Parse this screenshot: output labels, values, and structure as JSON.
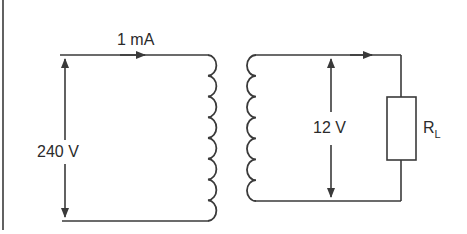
{
  "diagram": {
    "type": "transformer-circuit",
    "primary": {
      "current_label": "1 mA",
      "voltage_label": "240 V",
      "coil_turns": 8
    },
    "secondary": {
      "voltage_label": "12 V",
      "coil_turns": 7,
      "load": {
        "label_main": "R",
        "label_sub": "L"
      }
    },
    "colors": {
      "line": "#3a3a3a",
      "text": "#2b2b2b",
      "background": "#ffffff"
    }
  }
}
